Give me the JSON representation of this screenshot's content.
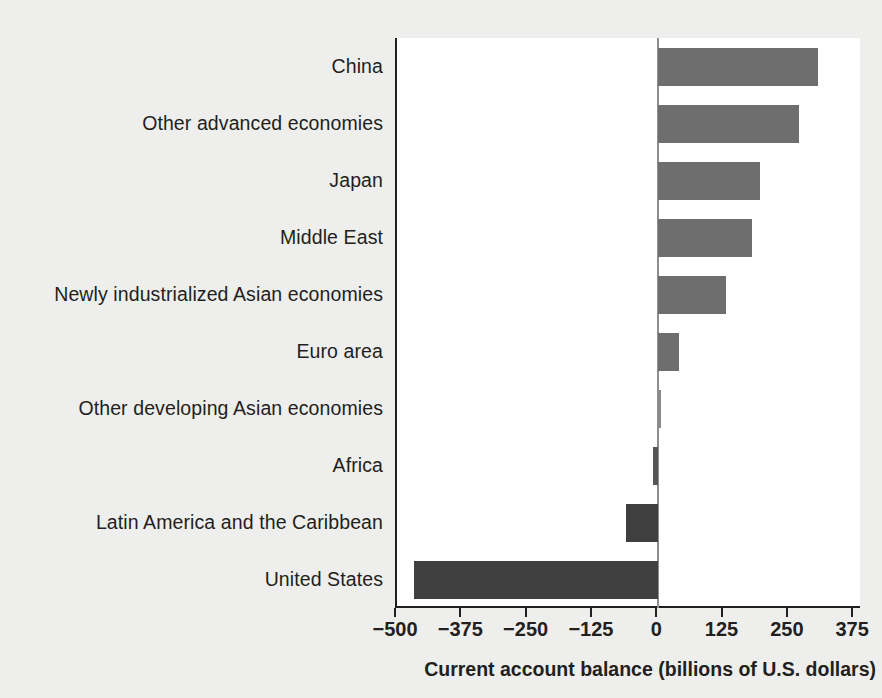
{
  "chart_data": {
    "type": "bar",
    "orientation": "horizontal",
    "title": "",
    "xlabel": "Current account balance (billions of U.S. dollars)",
    "ylabel": "",
    "xlim": [
      -500,
      390
    ],
    "xticks": [
      -500,
      -375,
      -250,
      -125,
      0,
      125,
      250,
      375
    ],
    "xticklabels": [
      "−500",
      "−375",
      "−250",
      "−125",
      "0",
      "125",
      "250",
      "375"
    ],
    "grid": false,
    "legend": null,
    "zero_line": 0,
    "categories": [
      "China",
      "Other advanced economies",
      "Japan",
      "Middle East",
      "Newly industrialized Asian economies",
      "Euro area",
      "Other developing Asian economies",
      "Africa",
      "Latin America and the Caribbean",
      "United States"
    ],
    "values": [
      305,
      270,
      195,
      180,
      130,
      40,
      6,
      -10,
      -62,
      -467
    ],
    "bar_colors": [
      "#6e6e6e",
      "#6e6e6e",
      "#6e6e6e",
      "#6e6e6e",
      "#6e6e6e",
      "#6e6e6e",
      "#8a8a8a",
      "#555555",
      "#3f3f3f",
      "#404040"
    ]
  },
  "colors": {
    "background": "#eeeeec",
    "plot_background": "#ffffff",
    "axis": "#231f20",
    "zero_line": "#8e8e8e",
    "bar_positive": "#6e6e6e",
    "bar_negative": "#404040",
    "text": "#231f20"
  }
}
